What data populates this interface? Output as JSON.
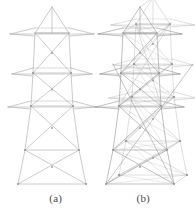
{
  "figure": {
    "background_color": "#ffffff",
    "line_color": "#a8a8a8",
    "line_color_dark": "#8c8c8c",
    "node_color": "#9a9a9a",
    "caption_color": "#4a4a4a",
    "panels": [
      {
        "id": "a",
        "label": "(a)",
        "view": "planar-elevation",
        "title": "Planar elevation view of lattice transmission tower model"
      },
      {
        "id": "b",
        "label": "(b)",
        "view": "three-dimensional-perspective",
        "title": "Three-dimensional perspective view of lattice transmission tower model"
      }
    ]
  },
  "chart_data": {
    "type": "diagram",
    "subtitle": "",
    "xlabel": "",
    "ylabel": "",
    "grid": false,
    "legend": false,
    "panels": [
      {
        "label": "(a)",
        "view": "planar elevation (front view)",
        "description": "Two-dimensional front elevation of a steel lattice transmission tower showing the peak mast, three cross-arm levels and X-braced body panels.",
        "levels": [
          {
            "name": "peak-apex",
            "y": 7,
            "half_width": 1
          },
          {
            "name": "peak-base",
            "y": 33,
            "half_width": 17
          },
          {
            "name": "cross-arm-1",
            "y": 40,
            "half_width": 42
          },
          {
            "name": "cross-arm-2",
            "y": 73,
            "half_width": 40
          },
          {
            "name": "waist",
            "y": 106,
            "half_width": 23
          },
          {
            "name": "cross-arm-3",
            "y": 118,
            "half_width": 44
          },
          {
            "name": "body-mid",
            "y": 150,
            "half_width": 30
          },
          {
            "name": "base",
            "y": 184,
            "half_width": 36
          }
        ],
        "bracing": "X-braced panels between every pair of adjacent levels",
        "member_count_visible": 62,
        "node_count_visible": 24
      },
      {
        "label": "(b)",
        "view": "three-dimensional perspective",
        "description": "Perspective rendering of the same lattice transmission tower, with front and rear faces, four legs and full three-dimensional cross bracing visible.",
        "levels": [
          {
            "name": "peak-apex",
            "y": 7,
            "half_width": 1
          },
          {
            "name": "peak-base",
            "y": 33,
            "half_width": 17
          },
          {
            "name": "cross-arm-1",
            "y": 40,
            "half_width": 42
          },
          {
            "name": "cross-arm-2",
            "y": 73,
            "half_width": 40
          },
          {
            "name": "waist",
            "y": 106,
            "half_width": 23
          },
          {
            "name": "cross-arm-3",
            "y": 118,
            "half_width": 44
          },
          {
            "name": "body-mid",
            "y": 150,
            "half_width": 30
          },
          {
            "name": "base",
            "y": 184,
            "half_width": 36
          }
        ],
        "perspective_offset_x": 13,
        "perspective_offset_y": -9,
        "bracing": "X-braced panels on all four faces plus plan bracing at each cross-arm level",
        "member_count_visible": 148,
        "node_count_visible": 48
      }
    ]
  }
}
